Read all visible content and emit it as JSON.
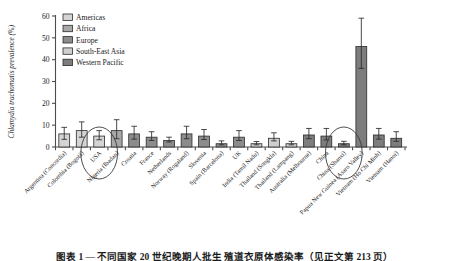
{
  "figure": {
    "caption": "图表 1 — 不同国家 20 世纪晚期人批生 殖道衣原体感染率（见正文第 213 页）"
  },
  "chart_data": {
    "type": "bar",
    "title": "",
    "xlabel": "",
    "ylabel": "Chlamydia trachomatis prevalence (%)",
    "ylim": [
      0,
      60
    ],
    "yticks": [
      0,
      10,
      20,
      30,
      40,
      50,
      60
    ],
    "ytick_labels": [
      "0",
      "10",
      "20",
      "30",
      "40",
      "50",
      "60"
    ],
    "grid": false,
    "legend_position": "top-left",
    "legend": [
      {
        "label": "Americas",
        "color": "#d4d4d4"
      },
      {
        "label": "Africa",
        "color": "#a8a8a8"
      },
      {
        "label": "Europe",
        "color": "#8c8c8c"
      },
      {
        "label": "South-East Asia",
        "color": "#cfcfcf"
      },
      {
        "label": "Western Pacific",
        "color": "#7d7d7d"
      }
    ],
    "categories": [
      "Argentina (Concordia)",
      "Colombia (Bogotá)",
      "USA",
      "Nigeria (Ibadan)",
      "Croatia",
      "France",
      "Netherlands",
      "Norway (Rogaland)",
      "Slovenia",
      "Spain (Barcelona)",
      "UK",
      "India (Tamil Nadu)",
      "Thailand (Songkla)",
      "Thailand (Lampang)",
      "Australia (Melbourne)",
      "China",
      "China (Shanxi)",
      "Papua New Guinea (Asaro Valley)",
      "Vietnam (Ho Chi Minh)",
      "Vietnam (Hanoi)"
    ],
    "regions": [
      "Americas",
      "Americas",
      "Americas",
      "Africa",
      "Europe",
      "Europe",
      "Europe",
      "Europe",
      "Europe",
      "Europe",
      "Europe",
      "South-East Asia",
      "South-East Asia",
      "South-East Asia",
      "Western Pacific",
      "Western Pacific",
      "Western Pacific",
      "Western Pacific",
      "Western Pacific",
      "Western Pacific"
    ],
    "values": [
      6.0,
      7.5,
      5.0,
      7.5,
      6.0,
      4.5,
      3.0,
      6.0,
      5.0,
      1.5,
      4.5,
      1.5,
      4.0,
      1.5,
      5.5,
      5.0,
      1.5,
      46.0,
      5.5,
      4.0
    ],
    "err_low": [
      3.5,
      4.5,
      3.3,
      3.8,
      3.6,
      3.0,
      2.3,
      3.8,
      3.4,
      1.0,
      3.0,
      1.0,
      2.8,
      1.0,
      3.8,
      3.2,
      1.0,
      36.0,
      3.6,
      2.6
    ],
    "err_high": [
      9.0,
      11.5,
      7.5,
      12.5,
      9.5,
      7.0,
      4.5,
      9.5,
      8.0,
      2.8,
      7.5,
      2.5,
      6.5,
      2.6,
      8.5,
      8.5,
      2.6,
      59.0,
      8.5,
      7.0
    ],
    "annotations": [
      {
        "type": "ellipse",
        "target": "USA",
        "note": "circled"
      },
      {
        "type": "ellipse",
        "target": "China (Shanxi)",
        "note": "circled"
      }
    ]
  }
}
